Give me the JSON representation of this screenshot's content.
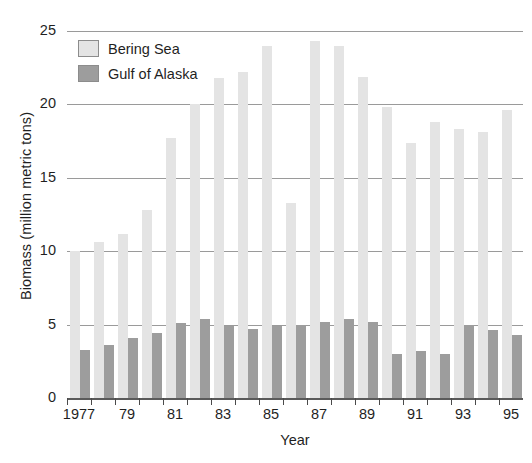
{
  "chart_data": {
    "type": "bar",
    "title": "",
    "subtitle": "",
    "xlabel": "Year",
    "ylabel": "Biomass (million metric tons)",
    "ylim": [
      0,
      25
    ],
    "yticks": [
      0,
      5,
      10,
      15,
      20,
      25
    ],
    "ytick_labels": [
      "0",
      "5",
      "10",
      "15",
      "20",
      "25"
    ],
    "grid": true,
    "grid_axis": "y",
    "legend_position": "top-left",
    "x": [
      1977,
      1978,
      1979,
      1980,
      1981,
      1982,
      1983,
      1984,
      1985,
      1986,
      1987,
      1988,
      1989,
      1990,
      1991,
      1992,
      1993,
      1994,
      1995
    ],
    "categories": [
      "1977",
      "1978",
      "1979",
      "1980",
      "1981",
      "1982",
      "1983",
      "1984",
      "1985",
      "1986",
      "1987",
      "1988",
      "1989",
      "1990",
      "1991",
      "1992",
      "1993",
      "1994",
      "1995"
    ],
    "xtick_labels": [
      "1977",
      "79",
      "81",
      "83",
      "85",
      "87",
      "89",
      "91",
      "93",
      "95"
    ],
    "xtick_values": [
      1977,
      1979,
      1981,
      1983,
      1985,
      1987,
      1989,
      1991,
      1993,
      1995
    ],
    "series": [
      {
        "name": "Bering Sea",
        "color": "#e4e4e4",
        "values": [
          10.0,
          10.6,
          11.2,
          12.8,
          17.7,
          20.0,
          21.8,
          22.2,
          24.0,
          13.3,
          24.3,
          24.0,
          21.9,
          19.8,
          17.4,
          18.8,
          18.3,
          18.1,
          19.6
        ]
      },
      {
        "name": "Gulf of Alaska",
        "color": "#9d9d9d",
        "values": [
          3.3,
          3.6,
          4.1,
          4.4,
          5.1,
          5.4,
          4.9,
          4.7,
          4.9,
          5.0,
          5.2,
          5.4,
          5.2,
          3.0,
          3.2,
          3.0,
          5.0,
          4.6,
          4.3
        ]
      }
    ]
  },
  "legend": {
    "items": [
      {
        "label": "Bering Sea",
        "color": "#e4e4e4"
      },
      {
        "label": "Gulf of Alaska",
        "color": "#9d9d9d"
      }
    ]
  },
  "axes": {
    "y_title": "Biomass (million metric tons)",
    "x_title": "Year"
  }
}
